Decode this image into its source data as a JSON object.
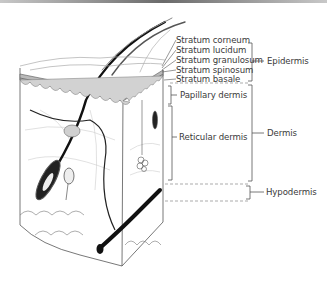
{
  "figure": {
    "strata": [
      {
        "label": "Stratum corneum",
        "x": 176,
        "y": 35
      },
      {
        "label": "Stratum lucidum",
        "x": 176,
        "y": 45
      },
      {
        "label": "Stratum granulosum",
        "x": 176,
        "y": 55
      },
      {
        "label": "Stratum spinosum",
        "x": 176,
        "y": 65
      },
      {
        "label": "Stratum basale",
        "x": 176,
        "y": 74
      }
    ],
    "sublayers": [
      {
        "label": "Papillary dermis",
        "x": 180,
        "y": 90
      },
      {
        "label": "Reticular dermis",
        "x": 179,
        "y": 132
      }
    ],
    "layers": [
      {
        "label": "Epidermis",
        "x": 267,
        "y": 57
      },
      {
        "label": "Dermis",
        "x": 267,
        "y": 129
      },
      {
        "label": "Hypodermis",
        "x": 266,
        "y": 187
      }
    ],
    "colors": {
      "line": "#555555",
      "epidermis_band": "#b9b9b9",
      "papillae": "#d2d2d2",
      "hair": "#111111"
    }
  }
}
